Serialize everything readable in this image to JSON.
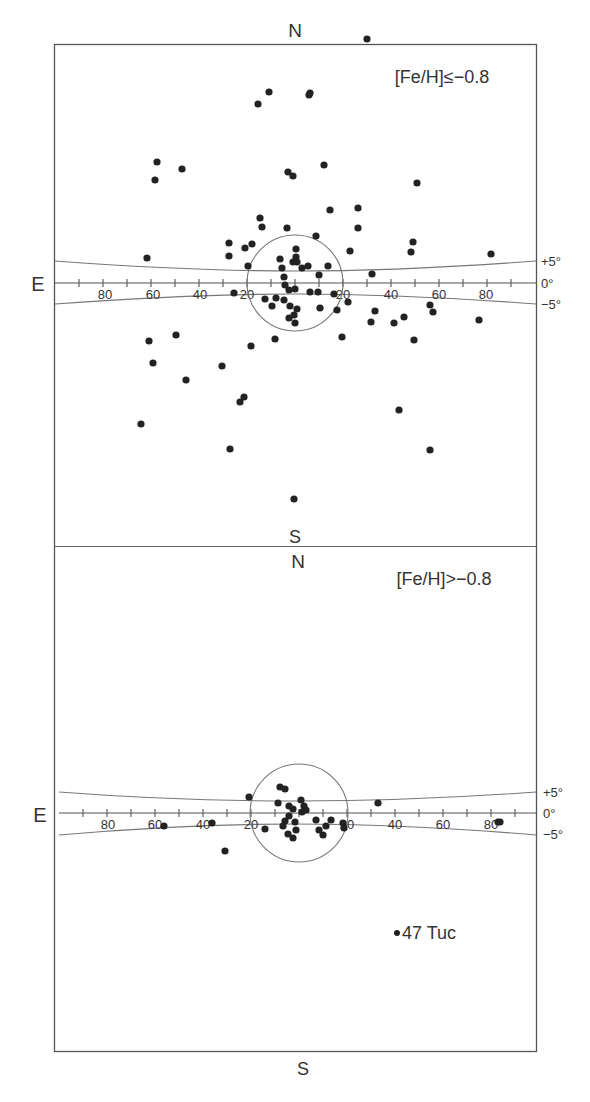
{
  "chart_data": [
    {
      "type": "scatter",
      "panel": "top",
      "title": "[Fe/H] ≤ −0.8",
      "label_text": "[Fe/H]≤−0.8",
      "compass": {
        "north": "N",
        "south": "S",
        "east": "E"
      },
      "xlabel": "Galactic longitude (deg)",
      "ylabel": "Galactic latitude",
      "x_ticks": [
        "80",
        "60",
        "40",
        "20",
        "20",
        "40",
        "60",
        "80"
      ],
      "y_band_labels": [
        "+5°",
        "0°",
        "−5°"
      ],
      "circle_radius_deg": 20,
      "grid": false,
      "points_px": [
        [
          367,
          39
        ],
        [
          269,
          92
        ],
        [
          258,
          104
        ],
        [
          310,
          93
        ],
        [
          309,
          95
        ],
        [
          157,
          162
        ],
        [
          155,
          180
        ],
        [
          182,
          169
        ],
        [
          288,
          172
        ],
        [
          293,
          176
        ],
        [
          324,
          165
        ],
        [
          417,
          183
        ],
        [
          330,
          210
        ],
        [
          358,
          208
        ],
        [
          358,
          228
        ],
        [
          260,
          218
        ],
        [
          262,
          227
        ],
        [
          287,
          228
        ],
        [
          316,
          236
        ],
        [
          350,
          251
        ],
        [
          413,
          242
        ],
        [
          411,
          252
        ],
        [
          491,
          254
        ],
        [
          229,
          243
        ],
        [
          245,
          248
        ],
        [
          252,
          244
        ],
        [
          229,
          256
        ],
        [
          147,
          258
        ],
        [
          280,
          259
        ],
        [
          296,
          249
        ],
        [
          296,
          257
        ],
        [
          293,
          262
        ],
        [
          297,
          262
        ],
        [
          302,
          268
        ],
        [
          282,
          268
        ],
        [
          308,
          266
        ],
        [
          328,
          266
        ],
        [
          319,
          275
        ],
        [
          372,
          274
        ],
        [
          248,
          266
        ],
        [
          284,
          277
        ],
        [
          285,
          285
        ],
        [
          289,
          290
        ],
        [
          310,
          292
        ],
        [
          318,
          292
        ],
        [
          334,
          294
        ],
        [
          295,
          289
        ],
        [
          234,
          293
        ],
        [
          284,
          300
        ],
        [
          276,
          298
        ],
        [
          290,
          306
        ],
        [
          265,
          299
        ],
        [
          289,
          318
        ],
        [
          294,
          315
        ],
        [
          297,
          309
        ],
        [
          272,
          306
        ],
        [
          295,
          323
        ],
        [
          320,
          308
        ],
        [
          337,
          310
        ],
        [
          348,
          302
        ],
        [
          375,
          311
        ],
        [
          371,
          322
        ],
        [
          404,
          317
        ],
        [
          394,
          323
        ],
        [
          430,
          305
        ],
        [
          433,
          312
        ],
        [
          479,
          320
        ],
        [
          414,
          340
        ],
        [
          342,
          337
        ],
        [
          251,
          346
        ],
        [
          275,
          339
        ],
        [
          149,
          341
        ],
        [
          176,
          335
        ],
        [
          153,
          363
        ],
        [
          222,
          366
        ],
        [
          186,
          380
        ],
        [
          240,
          402
        ],
        [
          244,
          397
        ],
        [
          141,
          424
        ],
        [
          399,
          410
        ],
        [
          230,
          449
        ],
        [
          430,
          450
        ],
        [
          294,
          499
        ]
      ]
    },
    {
      "type": "scatter",
      "panel": "bottom",
      "title": "[Fe/H] > −0.8",
      "label_text": "[Fe/H]>−0.8",
      "compass": {
        "north": "N",
        "south": "S",
        "east": "E"
      },
      "x_ticks": [
        "80",
        "60",
        "40",
        "20",
        "20",
        "40",
        "60",
        "80"
      ],
      "y_band_labels": [
        "+5°",
        "0°",
        "−5°"
      ],
      "circle_radius_deg": 20,
      "grid": false,
      "annotation": "47 Tuc",
      "annotation_point_px": [
        397,
        933
      ],
      "points_px": [
        [
          249,
          797
        ],
        [
          280,
          787
        ],
        [
          285,
          789
        ],
        [
          278,
          803
        ],
        [
          289,
          806
        ],
        [
          293,
          809
        ],
        [
          289,
          816
        ],
        [
          285,
          821
        ],
        [
          283,
          826
        ],
        [
          295,
          822
        ],
        [
          296,
          830
        ],
        [
          301,
          800
        ],
        [
          304,
          806
        ],
        [
          302,
          812
        ],
        [
          306,
          810
        ],
        [
          316,
          820
        ],
        [
          326,
          826
        ],
        [
          331,
          820
        ],
        [
          319,
          830
        ],
        [
          323,
          835
        ],
        [
          343,
          823
        ],
        [
          344,
          828
        ],
        [
          265,
          829
        ],
        [
          288,
          834
        ],
        [
          293,
          838
        ],
        [
          378,
          803
        ],
        [
          225,
          851
        ],
        [
          212,
          823
        ],
        [
          164,
          826
        ],
        [
          500,
          822
        ],
        [
          498,
          822
        ]
      ]
    }
  ],
  "labels": {
    "top_north": "N",
    "top_south": "S",
    "top_east": "E",
    "top_title": "[Fe/H]≤−0.8",
    "bottom_north": "N",
    "bottom_south": "S",
    "bottom_east": "E",
    "bottom_title": "[Fe/H]>−0.8",
    "plus5": "+5°",
    "zero": "0°",
    "minus5": "−5°",
    "tuc": "47 Tuc",
    "tick_80": "80",
    "tick_60": "60",
    "tick_40": "40",
    "tick_20": "20"
  }
}
